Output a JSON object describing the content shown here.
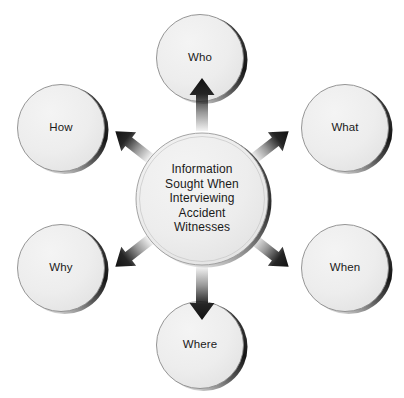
{
  "diagram": {
    "type": "hub-and-spoke",
    "background_color": "#ffffff",
    "node_fill_color": "#ededed",
    "node_stroke_color": "#808080",
    "node_shadow_color": "#1c1c1c",
    "arrow_color": "#1a1a1a",
    "text_color": "#1a1a1a",
    "center": {
      "id": "center-node",
      "name": "center-node",
      "label": "Information Sought When Interviewing Accident Witnesses",
      "lines": [
        "Information",
        "Sought When",
        "Interviewing",
        "Accident",
        "Witnesses"
      ],
      "cx": 202,
      "cy": 199,
      "r": 67
    },
    "satellites": [
      {
        "id": "who",
        "name": "node-who",
        "label": "Who",
        "position": "top",
        "cx": 200,
        "cy": 58,
        "r": 45,
        "arrow": {
          "name": "arrow-to-who",
          "direction": "up",
          "angle": -90
        }
      },
      {
        "id": "what",
        "name": "node-what",
        "label": "What",
        "position": "top-right",
        "cx": 345,
        "cy": 128,
        "r": 45,
        "arrow": {
          "name": "arrow-to-what",
          "direction": "up-right",
          "angle": -38
        }
      },
      {
        "id": "when",
        "name": "node-when",
        "label": "When",
        "position": "bottom-right",
        "cx": 345,
        "cy": 268,
        "r": 45,
        "arrow": {
          "name": "arrow-to-when",
          "direction": "down-right",
          "angle": 38
        }
      },
      {
        "id": "where",
        "name": "node-where",
        "label": "Where",
        "position": "bottom",
        "cx": 200,
        "cy": 345,
        "r": 45,
        "arrow": {
          "name": "arrow-to-where",
          "direction": "down",
          "angle": 90
        }
      },
      {
        "id": "why",
        "name": "node-why",
        "label": "Why",
        "position": "bottom-left",
        "cx": 61,
        "cy": 268,
        "r": 45,
        "arrow": {
          "name": "arrow-to-why",
          "direction": "down-left",
          "angle": 142
        }
      },
      {
        "id": "how",
        "name": "node-how",
        "label": "How",
        "position": "top-left",
        "cx": 61,
        "cy": 128,
        "r": 45,
        "arrow": {
          "name": "arrow-to-how",
          "direction": "up-left",
          "angle": -142
        }
      }
    ]
  }
}
